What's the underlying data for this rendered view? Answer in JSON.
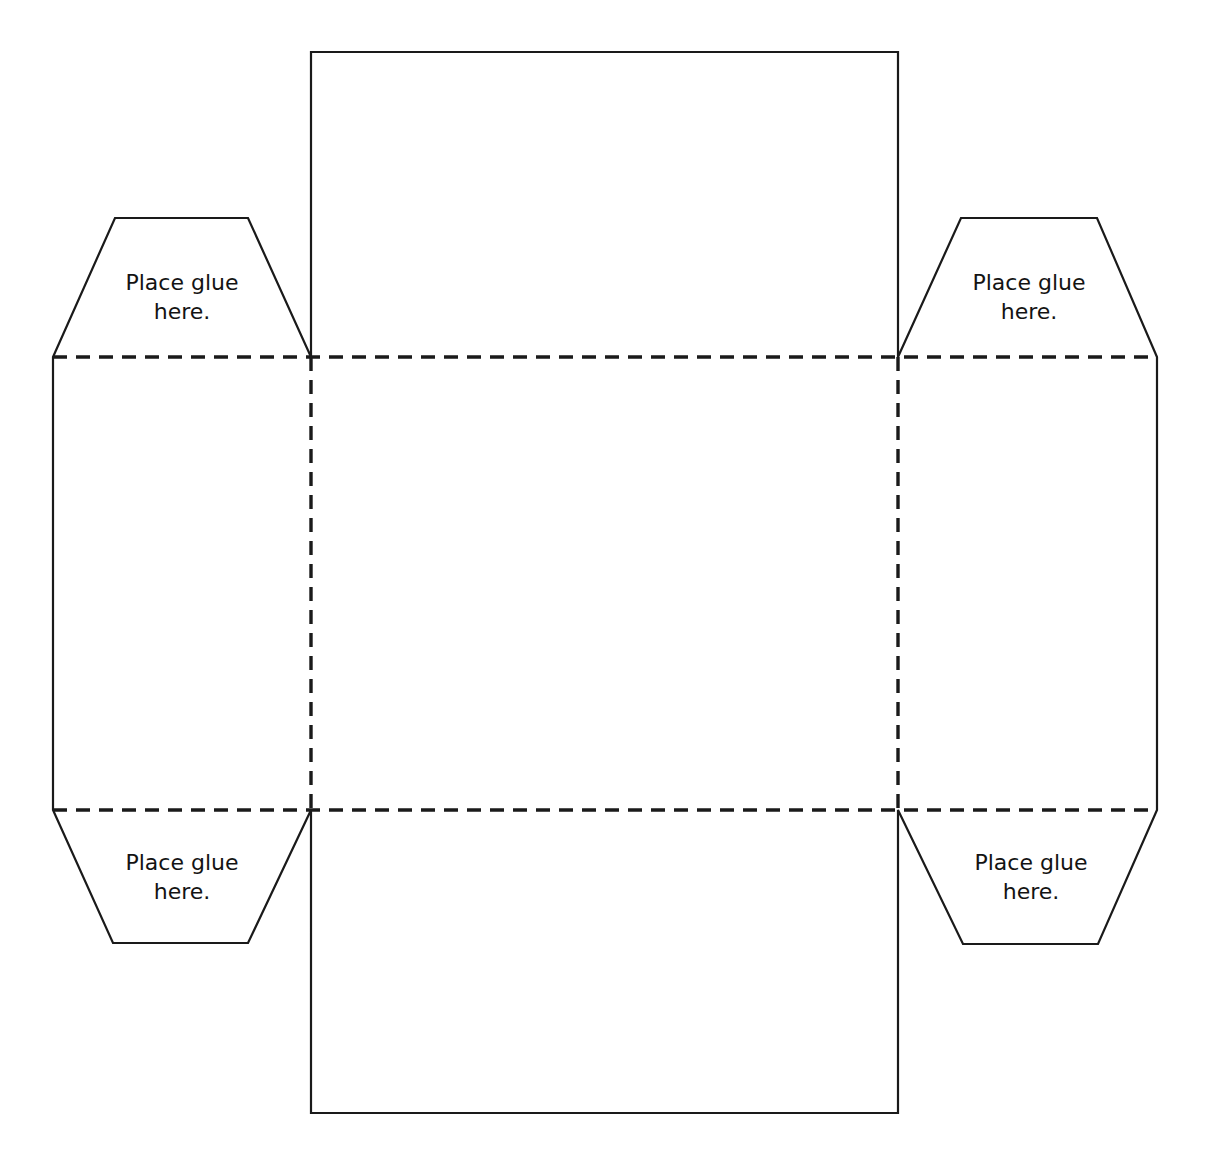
{
  "document": {
    "title": "Cube Box Papercraft Template",
    "type": "foldable-box-net",
    "background_color": "#ffffff",
    "cut_line_color": "#1a1a1a",
    "fold_line_color": "#1a1a1a",
    "text_color": "#131313",
    "canvas": {
      "width": 1209,
      "height": 1174
    }
  },
  "labels": {
    "glue_line_1": "Place glue",
    "glue_line_2": "here."
  },
  "flaps": [
    {
      "id": "top-left-glue-flap",
      "position": "top-left",
      "shape": "trapezoid",
      "line_1": "Place glue",
      "line_2": "here.",
      "text_x": 182,
      "text_y_line_1": 290,
      "text_y_line_2": 319,
      "points": "53,357 115,218 248,218 311,357"
    },
    {
      "id": "top-right-glue-flap",
      "position": "top-right",
      "shape": "trapezoid",
      "line_1": "Place glue",
      "line_2": "here.",
      "text_x": 1029,
      "text_y_line_1": 290,
      "text_y_line_2": 319,
      "points": "898,357 961,218 1097,218 1157,357"
    },
    {
      "id": "bottom-left-glue-flap",
      "position": "bottom-left",
      "shape": "trapezoid",
      "line_1": "Place glue",
      "line_2": "here.",
      "text_x": 182,
      "text_y_line_1": 870,
      "text_y_line_2": 899,
      "points": "53,810 113,943 248,943 311,810"
    },
    {
      "id": "bottom-right-glue-flap",
      "position": "bottom-right",
      "shape": "trapezoid",
      "line_1": "Place glue",
      "line_2": "here.",
      "text_x": 1031,
      "text_y_line_1": 870,
      "text_y_line_2": 899,
      "points": "898,810 963,944 1098,944 1157,810"
    }
  ],
  "panels": [
    {
      "id": "top-panel",
      "role": "lid",
      "x": 311,
      "y": 52,
      "width": 587,
      "height": 305
    },
    {
      "id": "left-panel",
      "role": "side",
      "x": 53,
      "y": 357,
      "width": 258,
      "height": 453
    },
    {
      "id": "center-panel",
      "role": "base",
      "x": 311,
      "y": 357,
      "width": 587,
      "height": 453
    },
    {
      "id": "right-panel",
      "role": "side",
      "x": 898,
      "y": 357,
      "width": 259,
      "height": 453
    },
    {
      "id": "bottom-panel",
      "role": "front",
      "x": 311,
      "y": 810,
      "width": 587,
      "height": 303
    }
  ],
  "cut_outline": {
    "points": "311,52 898,52 898,357 961,218 1097,218 1157,357 1157,810 1098,944 963,944 898,810 898,1113 311,1113 311,810 248,943 113,943 53,810 53,357 115,218 248,218 311,357"
  },
  "fold_lines": [
    {
      "id": "fold-top-horizontal",
      "orientation": "horizontal",
      "x1": 53,
      "y1": 357,
      "x2": 1157,
      "y2": 357
    },
    {
      "id": "fold-bottom-horizontal",
      "orientation": "horizontal",
      "x1": 53,
      "y1": 810,
      "x2": 1157,
      "y2": 810
    },
    {
      "id": "fold-left-vertical",
      "orientation": "vertical",
      "x1": 311,
      "y1": 357,
      "x2": 311,
      "y2": 810
    },
    {
      "id": "fold-right-vertical",
      "orientation": "vertical",
      "x1": 898,
      "y1": 357,
      "x2": 898,
      "y2": 810
    }
  ]
}
